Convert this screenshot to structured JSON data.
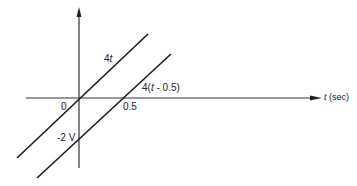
{
  "diagram": {
    "axes": {
      "horizontal_label_var": "t",
      "horizontal_label_unit": " (sec)",
      "origin_label": "0"
    },
    "lines": [
      {
        "name": "4t",
        "label_prefix": "4",
        "label_var": "t",
        "label_suffix": ""
      },
      {
        "name": "4(t - 0.5)",
        "label_prefix": "4(",
        "label_var": "t",
        "label_suffix": " - 0.5)"
      }
    ],
    "tick_labels": {
      "x_intercept": "0.5",
      "y_intercept": "-2 V"
    },
    "colors": {
      "line": "#1a1a1a",
      "background": "#ffffff"
    }
  }
}
